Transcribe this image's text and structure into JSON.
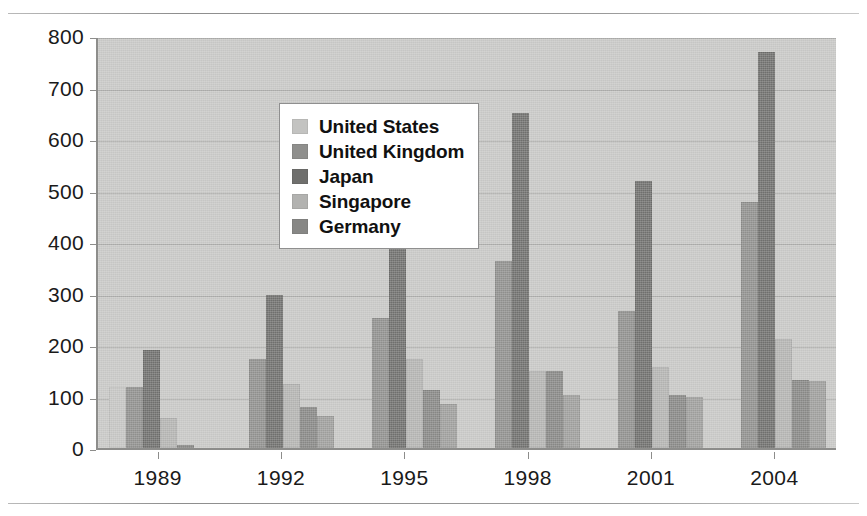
{
  "chart_data": {
    "type": "bar",
    "title": "",
    "subtitle": "",
    "xlabel": "",
    "ylabel": "",
    "categories": [
      "1989",
      "1992",
      "1995",
      "1998",
      "2001",
      "2004"
    ],
    "ylim": [
      0,
      800
    ],
    "ytick_values": [
      0,
      100,
      200,
      300,
      400,
      500,
      600,
      700,
      800
    ],
    "ytick_labels": [
      "0",
      "100",
      "200",
      "300",
      "400",
      "500",
      "600",
      "700",
      "800"
    ],
    "grid": true,
    "legend_position": "upper-left-inside",
    "series": [
      {
        "name": "United States",
        "color": "#c3c3c1",
        "values": [
          118,
          0,
          0,
          0,
          0,
          0
        ]
      },
      {
        "name": "United Kingdom",
        "color": "#8f8f8d",
        "values": [
          118,
          172,
          252,
          363,
          267,
          477
        ]
      },
      {
        "name": "Japan",
        "color": "#6f6f6d",
        "values": [
          190,
          297,
          478,
          650,
          518,
          768
        ]
      },
      {
        "name": "Singapore",
        "color": "#b2b2b0",
        "values": [
          58,
          125,
          172,
          150,
          158,
          212
        ]
      },
      {
        "name": "Germany",
        "color": "#878785",
        "values": [
          5,
          80,
          112,
          150,
          103,
          132
        ]
      }
    ],
    "extra_series": [
      {
        "name": "sixth-bar",
        "color": "#9d9d9b",
        "values": [
          0,
          62,
          85,
          103,
          100,
          130
        ]
      }
    ],
    "plot_background": "#c6c6c4",
    "axis_color": "#8d8d8b",
    "gridline_color": "#a9a9a7"
  },
  "legend": {
    "items": [
      {
        "label": "United States",
        "color": "#c3c3c1"
      },
      {
        "label": "United Kingdom",
        "color": "#8f8f8d"
      },
      {
        "label": "Japan",
        "color": "#6f6f6d"
      },
      {
        "label": "Singapore",
        "color": "#b2b2b0"
      },
      {
        "label": "Germany",
        "color": "#878785"
      }
    ]
  }
}
